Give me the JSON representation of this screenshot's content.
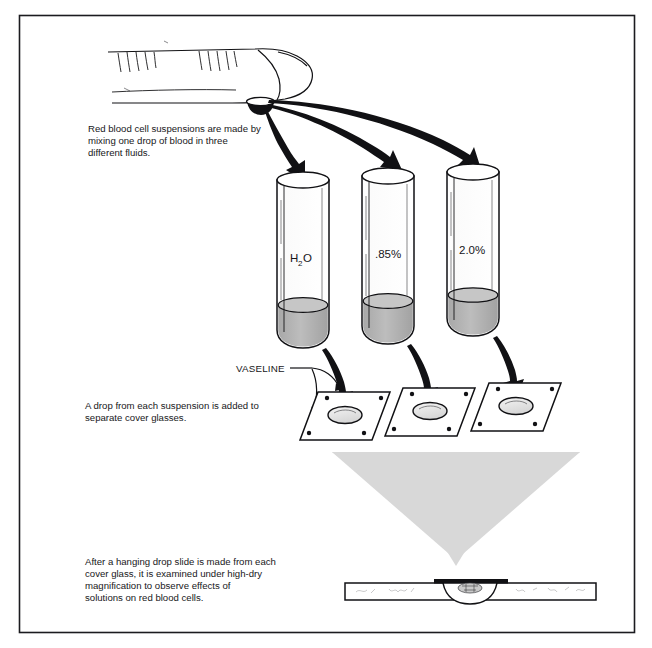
{
  "figure": {
    "border_color": "#1b1b1f",
    "background": "#ffffff",
    "ink_color": "#111114",
    "gray_arrow_color": "#d8d8d8",
    "liquid_color": "#b3b3b3"
  },
  "captions": {
    "step1": {
      "lines": [
        "Red blood cell suspensions are made by",
        "mixing one drop of blood in three",
        "different fluids."
      ]
    },
    "step2": {
      "lines": [
        "A drop from each suspension is added to",
        "separate cover glasses."
      ]
    },
    "step3": {
      "lines": [
        "After a hanging drop slide is made from each",
        "cover glass, it is examined under high-dry",
        "magnification to observe effects of",
        "solutions on red blood cells."
      ]
    }
  },
  "labels": {
    "vaseline": "VASELINE"
  },
  "tubes": [
    {
      "id": "tube-water",
      "label": "H",
      "sub": "2",
      "label_tail": "O",
      "fluid": "water"
    },
    {
      "id": "tube-saline-hypotonic",
      "label": ".85%",
      "sub": "",
      "label_tail": "",
      "fluid": "saline .85%"
    },
    {
      "id": "tube-saline-hypertonic",
      "label": "2.0%",
      "sub": "",
      "label_tail": "",
      "fluid": "saline 2.0%"
    }
  ],
  "cover_glasses": [
    {
      "id": "cover-glass-1"
    },
    {
      "id": "cover-glass-2"
    },
    {
      "id": "cover-glass-3"
    }
  ],
  "finger": {
    "name": "fingertip-with-blood-drop"
  },
  "slide": {
    "name": "hanging-drop-slide-side-view"
  }
}
